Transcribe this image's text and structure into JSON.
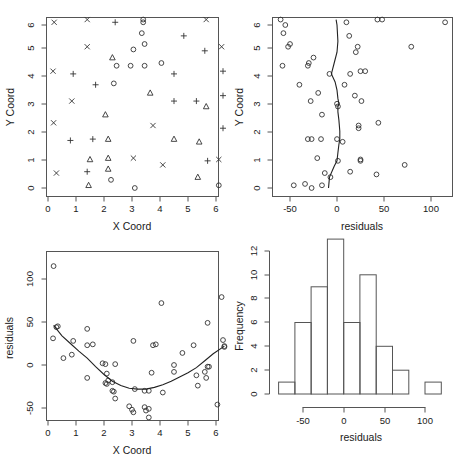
{
  "figure": {
    "background_color": "#ffffff",
    "axis_color": "#555555",
    "point_color": "#333333",
    "line_color": "#222222",
    "layout": "2x2 grid of R base-graphics plots"
  },
  "chart_data": [
    {
      "id": "panel-top-left",
      "type": "scatter",
      "title": "",
      "xlabel": "X Coord",
      "ylabel": "Y Coord",
      "xlim": [
        -0.05,
        6.45
      ],
      "ylim": [
        -0.25,
        6.45
      ],
      "xticks": [
        0,
        1,
        2,
        3,
        4,
        5,
        6
      ],
      "xticklabels": [
        "0",
        "1",
        "2",
        "3",
        "4",
        "5",
        "6"
      ],
      "yticks": [
        0,
        1,
        2,
        3,
        4,
        5,
        6
      ],
      "yticklabels": [
        "0",
        "1",
        "2",
        "3",
        "4",
        "5",
        "6"
      ],
      "grid": false,
      "legend": "none",
      "series": [
        {
          "name": "cross",
          "marker": "x",
          "points": [
            [
              0.22,
              6.1
            ],
            [
              1.4,
              6.2
            ],
            [
              5.65,
              6.2
            ],
            [
              1.4,
              5.2
            ],
            [
              6.2,
              5.2
            ],
            [
              0.18,
              4.3
            ],
            [
              0.85,
              3.2
            ],
            [
              0.2,
              2.4
            ],
            [
              3.75,
              2.3
            ],
            [
              3.05,
              1.1
            ],
            [
              4.1,
              0.85
            ],
            [
              0.3,
              0.55
            ],
            [
              6.1,
              1.05
            ]
          ]
        },
        {
          "name": "plus",
          "marker": "+",
          "points": [
            [
              2.4,
              6.1
            ],
            [
              4.85,
              5.6
            ],
            [
              5.6,
              5.05
            ],
            [
              6.25,
              4.3
            ],
            [
              0.9,
              4.2
            ],
            [
              4.5,
              4.2
            ],
            [
              1.7,
              3.8
            ],
            [
              6.25,
              3.4
            ],
            [
              4.5,
              3.2
            ],
            [
              5.3,
              3.2
            ],
            [
              6.25,
              2.2
            ],
            [
              0.8,
              1.75
            ],
            [
              1.6,
              1.8
            ],
            [
              1.4,
              0.6
            ],
            [
              5.7,
              1.0
            ]
          ]
        },
        {
          "name": "triangle",
          "marker": "triangle",
          "points": [
            [
              2.3,
              4.8
            ],
            [
              3.65,
              3.5
            ],
            [
              5.65,
              3.0
            ],
            [
              2.05,
              2.7
            ],
            [
              2.15,
              1.8
            ],
            [
              4.5,
              1.8
            ],
            [
              5.4,
              1.7
            ],
            [
              2.15,
              1.1
            ],
            [
              2.15,
              0.7
            ],
            [
              1.5,
              1.05
            ],
            [
              1.45,
              0.1
            ],
            [
              5.35,
              0.4
            ]
          ]
        },
        {
          "name": "circle",
          "marker": "o",
          "points": [
            [
              3.4,
              6.2
            ],
            [
              3.4,
              6.1
            ],
            [
              3.35,
              5.7
            ],
            [
              3.45,
              5.3
            ],
            [
              3.05,
              5.1
            ],
            [
              2.45,
              4.5
            ],
            [
              2.95,
              4.5
            ],
            [
              3.45,
              4.5
            ],
            [
              4.05,
              4.6
            ],
            [
              2.35,
              3.85
            ],
            [
              2.25,
              0.3
            ],
            [
              3.1,
              0.0
            ],
            [
              6.1,
              0.1
            ]
          ]
        }
      ]
    },
    {
      "id": "panel-top-right",
      "type": "scatter",
      "title": "",
      "xlabel": "residuals",
      "ylabel": "Y Coord",
      "xlim": [
        -70,
        122
      ],
      "ylim": [
        -0.25,
        6.45
      ],
      "xticks": [
        -50,
        0,
        50,
        100
      ],
      "xticklabels": [
        "-50",
        "0",
        "50",
        "100"
      ],
      "yticks": [
        0,
        1,
        2,
        3,
        4,
        5,
        6
      ],
      "yticklabels": [
        "0",
        "1",
        "2",
        "3",
        "4",
        "5",
        "6"
      ],
      "grid": false,
      "legend": "none",
      "points": [
        [
          -60,
          6.2
        ],
        [
          -55,
          6.0
        ],
        [
          10,
          6.1
        ],
        [
          43,
          6.2
        ],
        [
          48,
          6.2
        ],
        [
          115,
          6.1
        ],
        [
          -57,
          5.7
        ],
        [
          -52,
          5.2
        ],
        [
          -50,
          5.3
        ],
        [
          13,
          5.6
        ],
        [
          22,
          5.2
        ],
        [
          20,
          5.0
        ],
        [
          79,
          5.2
        ],
        [
          -58,
          4.5
        ],
        [
          -30,
          4.6
        ],
        [
          -31,
          4.5
        ],
        [
          -25,
          4.8
        ],
        [
          -8,
          4.2
        ],
        [
          14,
          4.2
        ],
        [
          25,
          4.3
        ],
        [
          30,
          4.3
        ],
        [
          -40,
          3.8
        ],
        [
          8,
          3.8
        ],
        [
          -20,
          3.5
        ],
        [
          19,
          3.4
        ],
        [
          -28,
          3.2
        ],
        [
          26,
          3.2
        ],
        [
          0,
          3.1
        ],
        [
          1,
          3.0
        ],
        [
          -16,
          2.7
        ],
        [
          23,
          2.3
        ],
        [
          23,
          2.2
        ],
        [
          44,
          2.4
        ],
        [
          -31,
          1.8
        ],
        [
          -27,
          1.8
        ],
        [
          -17,
          1.8
        ],
        [
          0,
          1.8
        ],
        [
          6,
          1.7
        ],
        [
          -21,
          1.1
        ],
        [
          25,
          1.05
        ],
        [
          25,
          1.0
        ],
        [
          1,
          1.0
        ],
        [
          72,
          0.85
        ],
        [
          14,
          0.6
        ],
        [
          -13,
          0.55
        ],
        [
          42,
          0.5
        ],
        [
          -7,
          0.4
        ],
        [
          -46,
          0.1
        ],
        [
          -34,
          0.15
        ],
        [
          -27,
          0.0
        ],
        [
          -16,
          0.1
        ]
      ],
      "lowess_note": "smoothed curve overlaid, roughly vertical near residual = 0"
    },
    {
      "id": "panel-bottom-left",
      "type": "scatter",
      "title": "",
      "xlabel": "X Coord",
      "ylabel": "residuals",
      "xlim": [
        -0.05,
        6.45
      ],
      "ylim": [
        -72,
        122
      ],
      "xticks": [
        0,
        1,
        2,
        3,
        4,
        5,
        6
      ],
      "xticklabels": [
        "0",
        "1",
        "2",
        "3",
        "4",
        "5",
        "6"
      ],
      "yticks": [
        -50,
        0,
        50,
        100
      ],
      "yticklabels": [
        "-50",
        "0",
        "50",
        "100"
      ],
      "grid": false,
      "legend": "none",
      "points": [
        [
          0.2,
          115
        ],
        [
          0.3,
          44
        ],
        [
          0.35,
          45
        ],
        [
          0.18,
          31
        ],
        [
          0.55,
          8
        ],
        [
          0.85,
          12
        ],
        [
          0.9,
          28
        ],
        [
          1.4,
          42
        ],
        [
          1.4,
          23
        ],
        [
          1.6,
          24
        ],
        [
          1.4,
          -15
        ],
        [
          1.95,
          2
        ],
        [
          2.05,
          1
        ],
        [
          2.1,
          -10
        ],
        [
          2.05,
          -21
        ],
        [
          2.1,
          -22
        ],
        [
          2.3,
          -30
        ],
        [
          2.35,
          -31
        ],
        [
          2.4,
          -39
        ],
        [
          2.4,
          1
        ],
        [
          2.15,
          -18
        ],
        [
          2.3,
          -20
        ],
        [
          3.05,
          28
        ],
        [
          3.1,
          -28
        ],
        [
          3.45,
          -30
        ],
        [
          3.6,
          -30
        ],
        [
          3.7,
          -9
        ],
        [
          3.75,
          23
        ],
        [
          4.05,
          72
        ],
        [
          3.85,
          24
        ],
        [
          4.1,
          -32
        ],
        [
          4.5,
          0
        ],
        [
          4.5,
          -8
        ],
        [
          4.8,
          14
        ],
        [
          5.2,
          23
        ],
        [
          5.3,
          -12
        ],
        [
          5.35,
          -24
        ],
        [
          5.6,
          -8
        ],
        [
          5.65,
          -15
        ],
        [
          5.7,
          49
        ],
        [
          5.7,
          -2
        ],
        [
          5.75,
          -2
        ],
        [
          6.05,
          -46
        ],
        [
          6.2,
          79
        ],
        [
          6.25,
          29
        ],
        [
          6.3,
          22
        ],
        [
          6.3,
          21
        ],
        [
          3.0,
          -52
        ],
        [
          3.05,
          -55
        ],
        [
          3.45,
          -49
        ],
        [
          3.5,
          -53
        ],
        [
          3.6,
          -51
        ],
        [
          3.6,
          -61
        ],
        [
          2.9,
          -48
        ]
      ],
      "lowess_note": "U-shaped smoothed curve, minimum near x = 3.2, residual = -28"
    },
    {
      "id": "panel-bottom-right",
      "type": "bar",
      "chart_subtype": "histogram",
      "title": "",
      "xlabel": "residuals",
      "ylabel": "Frequency",
      "xlim": [
        -80,
        125
      ],
      "ylim": [
        0,
        13
      ],
      "xticks": [
        -50,
        0,
        50,
        100
      ],
      "xticklabels": [
        "-50",
        "0",
        "50",
        "100"
      ],
      "yticks": [
        0,
        2,
        4,
        6,
        8,
        10,
        12
      ],
      "yticklabels": [
        "0",
        "2",
        "4",
        "6",
        "8",
        "10",
        "12"
      ],
      "grid": false,
      "legend": "none",
      "bin_width": 20,
      "bin_edges": [
        -80,
        -60,
        -40,
        -20,
        0,
        20,
        40,
        60,
        80,
        100,
        120
      ],
      "categories": [
        "-80 to -60",
        "-60 to -40",
        "-40 to -20",
        "-20 to 0",
        "0 to 20",
        "20 to 40",
        "40 to 60",
        "60 to 80",
        "80 to 100",
        "100 to 120"
      ],
      "values": [
        1,
        6,
        9,
        13,
        6,
        10,
        4,
        2,
        0,
        1
      ]
    }
  ]
}
